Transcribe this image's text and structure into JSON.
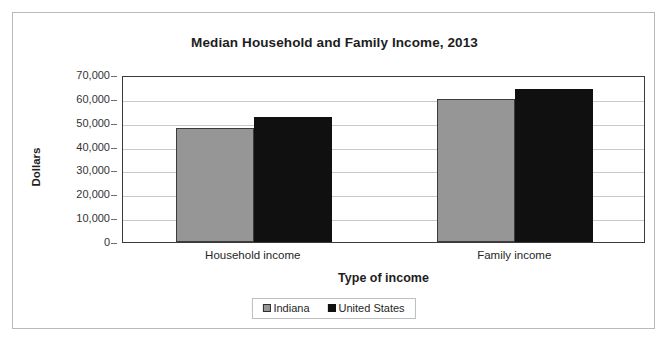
{
  "chart_data": {
    "type": "bar",
    "title": "Median Household and Family Income, 2013",
    "xlabel": "Type of income",
    "ylabel": "Dollars",
    "categories": [
      "Household income",
      "Family income"
    ],
    "series": [
      {
        "name": "Indiana",
        "color": "#969696",
        "values": [
          47600,
          59800
        ]
      },
      {
        "name": "United States",
        "color": "#101010",
        "values": [
          52250,
          64000
        ]
      }
    ],
    "ylim": [
      0,
      70000
    ],
    "ytick_values": [
      0,
      10000,
      20000,
      30000,
      40000,
      50000,
      60000,
      70000
    ],
    "ytick_labels": [
      "0",
      "10,000",
      "20,000",
      "30,000",
      "40,000",
      "50,000",
      "60,000",
      "70,000"
    ],
    "grid": true,
    "legend_position": "bottom"
  }
}
